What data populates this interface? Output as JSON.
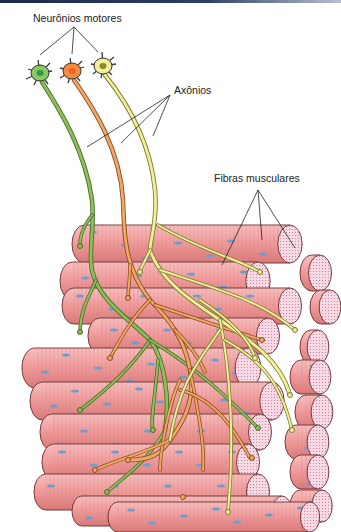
{
  "diagram": {
    "title_bar_color": "#1d2a4a",
    "labels": {
      "motor_neurons": "Neurônios motores",
      "axons": "Axônios",
      "muscle_fibers": "Fibras musculares"
    },
    "neurons": [
      {
        "name": "neuron-green",
        "cx": 40,
        "cy": 73,
        "body": "#8cc864",
        "nucleus": "#2f9a4a",
        "axon": "#8dbf5a"
      },
      {
        "name": "neuron-orange",
        "cx": 72,
        "cy": 71,
        "body": "#f58c3c",
        "nucleus": "#f0602a",
        "axon": "#f0a868"
      },
      {
        "name": "neuron-yellow",
        "cx": 103,
        "cy": 66,
        "body": "#f0ee9a",
        "nucleus": "#8a8a2a",
        "axon": "#f2ee9e"
      }
    ],
    "colors": {
      "fiber": "#f0a0a0",
      "fiber_dark": "#c86868",
      "fiber_end": "#f6d8e4",
      "nucleus": "#6a9ed0",
      "outline": "#5a2a2a"
    }
  }
}
